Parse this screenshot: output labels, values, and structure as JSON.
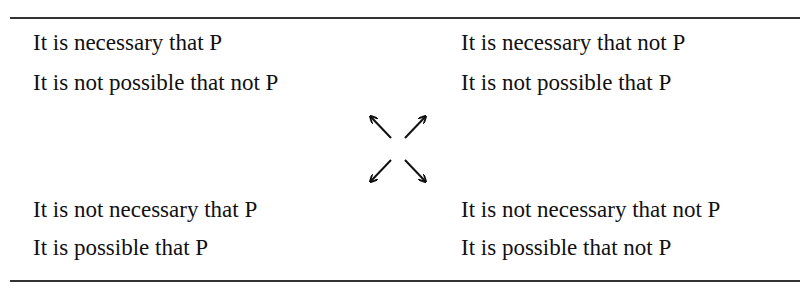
{
  "square": {
    "top_left": [
      "It is necessary that P",
      "It is not possible that not P"
    ],
    "top_right": [
      "It is necessary that not P",
      "It is not possible that P"
    ],
    "bottom_left": [
      "It is not necessary that P",
      "It is possible that P"
    ],
    "bottom_right": [
      "It is not necessary that not P",
      "It is possible that not P"
    ]
  },
  "center_icon": "four-diagonal-arrows-icon"
}
